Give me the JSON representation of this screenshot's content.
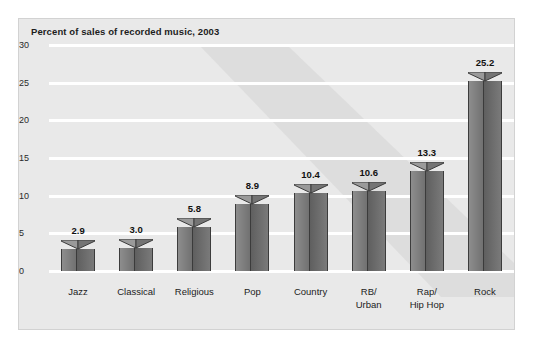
{
  "chart_data": {
    "type": "bar",
    "title": "Percent of sales of recorded music, 2003",
    "xlabel": "",
    "ylabel": "",
    "categories": [
      "Jazz",
      "Classical",
      "Religious",
      "Pop",
      "Country",
      "RB/ Urban",
      "Rap/ Hip Hop",
      "Rock"
    ],
    "category_lines": [
      [
        "Jazz"
      ],
      [
        "Classical"
      ],
      [
        "Religious"
      ],
      [
        "Pop"
      ],
      [
        "Country"
      ],
      [
        "RB/",
        "Urban"
      ],
      [
        "Rap/",
        "Hip Hop"
      ],
      [
        "Rock"
      ]
    ],
    "values": [
      2.9,
      3.0,
      5.8,
      8.9,
      10.4,
      10.6,
      13.3,
      25.2
    ],
    "value_labels": [
      "2.9",
      "3.0",
      "5.8",
      "8.9",
      "10.4",
      "10.6",
      "13.3",
      "25.2"
    ],
    "ylim": [
      0,
      30
    ],
    "yticks": [
      0,
      5,
      10,
      15,
      20,
      25,
      30
    ],
    "ytick_labels": [
      "0",
      "5",
      "10",
      "15",
      "20",
      "25",
      "30"
    ],
    "grid": true,
    "legend": null,
    "colors": {
      "plot_background": "#e9e9e9",
      "gridline": "#ffffff",
      "bar_left_face": "#8d8d8d",
      "bar_right_face": "#6b6b6b",
      "bar_outline": "#3c3c3c",
      "shadow_band": "#dcdcdc",
      "text": "#1d1d1d"
    }
  }
}
